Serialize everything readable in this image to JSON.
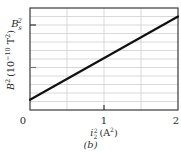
{
  "chart_data": {
    "type": "line",
    "title": "",
    "panel_label": "(b)",
    "xlabel": "i_2^2 (A^2)",
    "ylabel": "B^2 (10^-10 T^2)",
    "xlim": [
      0,
      2
    ],
    "ylim": [
      0,
      12
    ],
    "x_ticks": [
      0,
      1,
      2
    ],
    "x_tick_labels": [
      "0",
      "1",
      "2"
    ],
    "y_tick_labels": [],
    "y_annotations": [
      {
        "label": "B_s^2",
        "y": 10
      }
    ],
    "grid": true,
    "grid_x_step": 0.5,
    "grid_y_divisions": 12,
    "legend": null,
    "series": [
      {
        "name": "B^2 vs i_2^2",
        "x": [
          0,
          2
        ],
        "values": [
          1.2,
          11.0
        ],
        "color": "#111111"
      }
    ]
  },
  "labels": {
    "x_tick_0": "0",
    "x_tick_1": "1",
    "x_tick_2": "2",
    "x_axis_var": "i",
    "x_axis_sub": "2",
    "x_axis_sup": "2",
    "x_axis_unit": "(A",
    "x_axis_unit_sup": "2",
    "x_axis_unit_close": ")",
    "y_axis_var": "B",
    "y_axis_sup": "2",
    "y_axis_unit": "(10",
    "y_axis_unit_exp": "−10",
    "y_axis_unit_tail": " T",
    "y_axis_unit_tail_sup": "2",
    "y_axis_unit_close": ")",
    "bs_var": "B",
    "bs_sub": "s",
    "bs_sup": "2",
    "panel": "(b)"
  }
}
